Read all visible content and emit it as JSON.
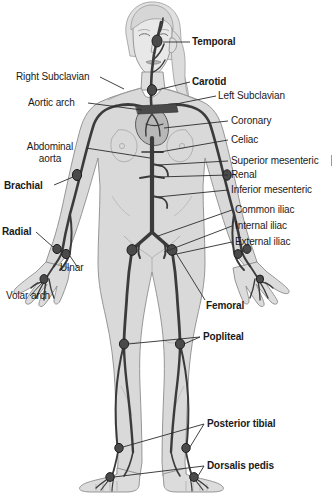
{
  "figure": {
    "background_color": "#ffffff",
    "text_color": "#1a1a1a",
    "artery_color": "#3b3b3b",
    "body_fill": "#d9d9d9",
    "body_outline": "#8c8c8c",
    "leader_color": "#2b2b2b",
    "width": 335,
    "height": 495
  },
  "labels": {
    "temporal": "Temporal",
    "right_subclavian": "Right Subclavian",
    "carotid": "Carotid",
    "left_subclavian": "Left Subclavian",
    "aortic_arch": "Aortic arch",
    "coronary": "Coronary",
    "abdominal_aorta_line1": "Abdominal",
    "abdominal_aorta_line2": "aorta",
    "celiac": "Celiac",
    "superior_mesenteric": "Superior mesenteric",
    "renal": "Renal",
    "inferior_mesenteric": "Inferior mesenteric",
    "brachial": "Brachial",
    "common_iliac": "Common iliac",
    "internal_iliac": "Internal iliac",
    "external_iliac": "External iliac",
    "radial": "Radial",
    "ulnar": "Ulnar",
    "volar_arch": "Volar arch",
    "femoral": "Femoral",
    "popliteal": "Popliteal",
    "posterior_tibial": "Posterior tibial",
    "dorsalis_pedis": "Dorsalis pedis"
  },
  "label_styles": {
    "temporal": "bold",
    "right_subclavian": "regular",
    "carotid": "bold",
    "left_subclavian": "regular",
    "aortic_arch": "regular",
    "coronary": "regular",
    "abdominal_aorta": "regular",
    "celiac": "regular",
    "superior_mesenteric": "regular",
    "renal": "regular",
    "inferior_mesenteric": "regular",
    "brachial": "bold",
    "common_iliac": "regular",
    "internal_iliac": "regular",
    "external_iliac": "regular",
    "radial": "bold",
    "ulnar": "regular",
    "volar_arch": "regular",
    "femoral": "bold",
    "popliteal": "bold",
    "posterior_tibial": "bold",
    "dorsalis_pedis": "bold"
  }
}
